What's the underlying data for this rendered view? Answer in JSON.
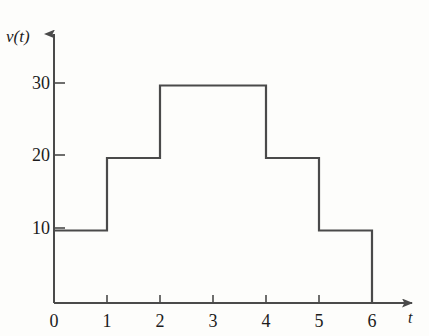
{
  "figure": {
    "background_color": "#fdfdfb",
    "line_color": "#4a4a4a",
    "text_color": "#1c1c1c"
  },
  "axes": {
    "y_title": "v(t)",
    "x_title": "t",
    "y_ticks": [
      {
        "label": "10",
        "value": 10
      },
      {
        "label": "20",
        "value": 20
      },
      {
        "label": "30",
        "value": 30
      }
    ],
    "x_ticks": [
      {
        "label": "0",
        "value": 0
      },
      {
        "label": "1",
        "value": 1
      },
      {
        "label": "2",
        "value": 2
      },
      {
        "label": "3",
        "value": 3
      },
      {
        "label": "4",
        "value": 4
      },
      {
        "label": "5",
        "value": 5
      },
      {
        "label": "6",
        "value": 6
      }
    ]
  },
  "chart_data": {
    "type": "bar",
    "title": "",
    "xlabel": "t",
    "ylabel": "v(t)",
    "xlim": [
      0,
      6
    ],
    "ylim": [
      0,
      35
    ],
    "grid": false,
    "legend": "none",
    "step_style": "piecewise-constant",
    "categories": [
      "0-1",
      "1-2",
      "2-3",
      "3-4",
      "4-5",
      "5-6"
    ],
    "values": [
      10,
      20,
      30,
      30,
      20,
      10
    ],
    "intervals": [
      {
        "t_start": 0,
        "t_end": 1,
        "v": 10
      },
      {
        "t_start": 1,
        "t_end": 2,
        "v": 20
      },
      {
        "t_start": 2,
        "t_end": 3,
        "v": 30
      },
      {
        "t_start": 3,
        "t_end": 4,
        "v": 30
      },
      {
        "t_start": 4,
        "t_end": 5,
        "v": 20
      },
      {
        "t_start": 5,
        "t_end": 6,
        "v": 10
      }
    ],
    "x_tick_labels": [
      "0",
      "1",
      "2",
      "3",
      "4",
      "5",
      "6"
    ],
    "y_tick_labels": [
      "10",
      "20",
      "30"
    ]
  }
}
